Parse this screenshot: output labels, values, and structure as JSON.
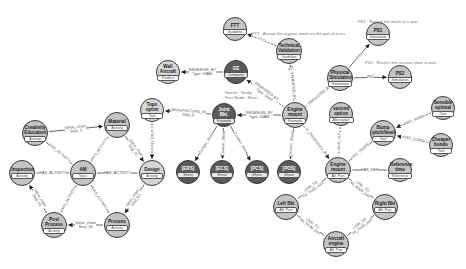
{
  "colors": {
    "node_fill": "#c4c4c4",
    "node_fill_light": "#d6d6d6",
    "node_fill_dark": "#5a5a5a",
    "node_border": "#3a3a3a",
    "edge": "#555555",
    "text": "#1a1a1a",
    "annotation": "#777777"
  },
  "nodes": [
    {
      "id": "creativity",
      "label": "Creativity Education",
      "type": "Activity",
      "x": 35,
      "y": 133,
      "r": 13,
      "shade": "mid"
    },
    {
      "id": "material",
      "label": "Material",
      "type": "Activity",
      "x": 117,
      "y": 125,
      "r": 13,
      "shade": "mid"
    },
    {
      "id": "topo",
      "label": "Topo optim",
      "type": "Tool",
      "x": 152,
      "y": 110,
      "r": 12,
      "shade": "light"
    },
    {
      "id": "am",
      "label": "AM",
      "type": "Topic",
      "x": 83,
      "y": 173,
      "r": 13,
      "shade": "mid"
    },
    {
      "id": "design",
      "label": "Design",
      "type": "Activity",
      "x": 152,
      "y": 173,
      "r": 13,
      "shade": "light"
    },
    {
      "id": "inspection",
      "label": "Inspection",
      "type": "Activity",
      "x": 22,
      "y": 173,
      "r": 13,
      "shade": "mid"
    },
    {
      "id": "postprocess",
      "label": "Post Process",
      "type": "Activity",
      "x": 54,
      "y": 225,
      "r": 13,
      "shade": "mid"
    },
    {
      "id": "process",
      "label": "Process",
      "type": "Activity",
      "x": 117,
      "y": 225,
      "r": 13,
      "shade": "mid"
    },
    {
      "id": "ftt",
      "label": "FTT",
      "type": "Guideline",
      "x": 235,
      "y": 29,
      "r": 12,
      "shade": "mid"
    },
    {
      "id": "tech",
      "label": "Technical Validation",
      "type": "Guideline",
      "x": 289,
      "y": 51,
      "r": 13,
      "shade": "mid"
    },
    {
      "id": "ge",
      "label": "GE",
      "type": "Company",
      "x": 236,
      "y": 72,
      "r": 12,
      "shade": "dark"
    },
    {
      "id": "nasa",
      "label": "Wall Aircraft",
      "type": "Product",
      "x": 168,
      "y": 72,
      "r": 12,
      "shade": "light"
    },
    {
      "id": "jointbkt",
      "label": "Joint Bkt.",
      "type": "Example",
      "x": 224,
      "y": 115,
      "r": 12,
      "shade": "dark"
    },
    {
      "id": "engine",
      "label": "Engine mount",
      "type": "Example",
      "x": 295,
      "y": 115,
      "r": 13,
      "shade": "mid"
    },
    {
      "id": "physical",
      "label": "Physical Simulation",
      "type": "Simulation",
      "x": 340,
      "y": 78,
      "r": 13,
      "shade": "mid"
    },
    {
      "id": "ps1",
      "label": "PS1",
      "type": "Simulation",
      "x": 378,
      "y": 34,
      "r": 12,
      "shade": "mid"
    },
    {
      "id": "ps2",
      "label": "PS2",
      "type": "Simulation",
      "x": 400,
      "y": 77,
      "r": 12,
      "shade": "mid"
    },
    {
      "id": "second",
      "label": "second option",
      "type": "Alternative",
      "x": 341,
      "y": 114,
      "r": 12,
      "shade": "mid"
    },
    {
      "id": "ers",
      "label": "[ERS]",
      "type": "Sheet",
      "x": 188,
      "y": 172,
      "r": 12,
      "shade": "dark"
    },
    {
      "id": "ecs",
      "label": "[ECS]",
      "type": "Sheet",
      "x": 222,
      "y": 172,
      "r": 12,
      "shade": "dark"
    },
    {
      "id": "pcs",
      "label": "[PCS]",
      "type": "Sheet",
      "x": 257,
      "y": 172,
      "r": 12,
      "shade": "dark"
    },
    {
      "id": "pos",
      "label": "[POS]",
      "type": "Sheet",
      "x": 289,
      "y": 172,
      "r": 12,
      "shade": "dark"
    },
    {
      "id": "enginemount2",
      "label": "Engine mount",
      "type": "Alt. Part",
      "x": 338,
      "y": 170,
      "r": 13,
      "shade": "mid"
    },
    {
      "id": "bump",
      "label": "Bump pitch/level",
      "type": "Tool",
      "x": 383,
      "y": 133,
      "r": 13,
      "shade": "mid"
    },
    {
      "id": "sensible",
      "label": "Sensible optimal",
      "type": "Tool",
      "x": 443,
      "y": 108,
      "r": 12,
      "shade": "mid"
    },
    {
      "id": "cheaper",
      "label": "Cheaper bonds",
      "type": "Tool",
      "x": 441,
      "y": 145,
      "r": 12,
      "shade": "mid"
    },
    {
      "id": "reference",
      "label": "Reference time",
      "type": "Reference",
      "x": 400,
      "y": 170,
      "r": 12,
      "shade": "mid"
    },
    {
      "id": "leftbkt",
      "label": "Left Bkt",
      "type": "Alt. Part",
      "x": 286,
      "y": 207,
      "r": 13,
      "shade": "mid"
    },
    {
      "id": "rightbkt",
      "label": "Right Bkt",
      "type": "Alt. Part",
      "x": 385,
      "y": 207,
      "r": 13,
      "shade": "mid"
    },
    {
      "id": "aircraft",
      "label": "Aircraft engine",
      "type": "Alt. Part",
      "x": 336,
      "y": 244,
      "r": 13,
      "shade": "mid"
    }
  ],
  "edges": [
    {
      "from": "creativity",
      "to": "material",
      "label": "Value_Chain\nStep_0",
      "style": "solid",
      "arrow": true
    },
    {
      "from": "material",
      "to": "design",
      "label": "Value_chain\nStep_02",
      "style": "solid",
      "arrow": true
    },
    {
      "from": "topo",
      "to": "design",
      "label": "Tool_Used",
      "style": "dashed",
      "arrow": true
    },
    {
      "from": "design",
      "to": "process",
      "label": "Value_chain\nStep_03",
      "style": "solid",
      "arrow": true
    },
    {
      "from": "process",
      "to": "postprocess",
      "label": "Value_chain\nStep_04",
      "style": "solid",
      "arrow": true
    },
    {
      "from": "postprocess",
      "to": "inspection",
      "label": "Value_chain\nStep_05",
      "style": "solid",
      "arrow": true
    },
    {
      "from": "am",
      "to": "creativity",
      "label": "HAS_ACTIVITY",
      "style": "solid",
      "arrow": false
    },
    {
      "from": "am",
      "to": "material",
      "label": "HAS_ACTIVITY",
      "style": "solid",
      "arrow": false
    },
    {
      "from": "am",
      "to": "design",
      "label": "HAS_ACTIVITY",
      "style": "solid",
      "arrow": false
    },
    {
      "from": "am",
      "to": "inspection",
      "label": "HAS_ACTIVITY",
      "style": "solid",
      "arrow": false
    },
    {
      "from": "am",
      "to": "process",
      "label": "HAS_ACTIVITY",
      "style": "solid",
      "arrow": false
    },
    {
      "from": "am",
      "to": "postprocess",
      "label": "HAS_ACTIVITY",
      "style": "solid",
      "arrow": false
    },
    {
      "from": "jointbkt",
      "to": "topo",
      "label": "MANUFACTURE_IN\nStep_8",
      "style": "solid",
      "arrow": true
    },
    {
      "from": "engine",
      "to": "jointbkt",
      "label": "REDESIGN_BY\nType: DfAM",
      "style": "solid",
      "arrow": true
    },
    {
      "from": "engine",
      "to": "ge",
      "label": "PROPOSED_BY\nType: Order",
      "style": "dashed",
      "arrow": true
    },
    {
      "from": "ge",
      "to": "nasa",
      "label": "REDESIGN_BY\nType: DfAM",
      "style": "solid",
      "arrow": true
    },
    {
      "from": "engine",
      "to": "tech",
      "label": "IS_VALIDATED_BY",
      "style": "dashed",
      "arrow": true
    },
    {
      "from": "tech",
      "to": "ftt",
      "label": "FTT",
      "style": "dashed",
      "arrow": true
    },
    {
      "from": "engine",
      "to": "physical",
      "label": "IS_SIMULATED_BY",
      "style": "dashed",
      "arrow": true
    },
    {
      "from": "physical",
      "to": "ps1",
      "label": "PS1",
      "style": "solid",
      "arrow": true
    },
    {
      "from": "physical",
      "to": "ps2",
      "label": "PS2",
      "style": "solid",
      "arrow": true
    },
    {
      "from": "jointbkt",
      "to": "ers",
      "label": "Contain_Sheet",
      "style": "solid",
      "arrow": true
    },
    {
      "from": "jointbkt",
      "to": "ecs",
      "label": "Contain_Sheet",
      "style": "solid",
      "arrow": true
    },
    {
      "from": "jointbkt",
      "to": "pcs",
      "label": "Contain_Sheet",
      "style": "solid",
      "arrow": true
    },
    {
      "from": "engine",
      "to": "pos",
      "label": "Contain_Sheet",
      "style": "solid",
      "arrow": true
    },
    {
      "from": "engine",
      "to": "enginemount2",
      "label": "IS_PROPOSED_BY",
      "style": "dashed",
      "arrow": true
    },
    {
      "from": "second",
      "to": "enginemount2",
      "label": "HAS_ALT",
      "style": "dashed",
      "arrow": false
    },
    {
      "from": "bump",
      "to": "enginemount2",
      "label": "HAS_SHAPE",
      "style": "solid",
      "arrow": false
    },
    {
      "from": "sensible",
      "to": "bump",
      "label": "HAS_SUBS",
      "style": "dashed",
      "arrow": true
    },
    {
      "from": "cheaper",
      "to": "bump",
      "label": "HAS_SUBS",
      "style": "dashed",
      "arrow": true
    },
    {
      "from": "reference",
      "to": "enginemount2",
      "label": "HAS_REF",
      "style": "solid",
      "arrow": false
    },
    {
      "from": "enginemount2",
      "to": "leftbkt",
      "label": "LINK_TO\nAlt_Node_part",
      "style": "solid",
      "arrow": false
    },
    {
      "from": "enginemount2",
      "to": "rightbkt",
      "label": "LINK_TO\nAlt_Node_part",
      "style": "solid",
      "arrow": false
    },
    {
      "from": "leftbkt",
      "to": "aircraft",
      "label": "LINK_TO\nAlt_Node_part",
      "style": "solid",
      "arrow": false
    },
    {
      "from": "rightbkt",
      "to": "aircraft",
      "label": "LINK_TO\nAlt_Node_part",
      "style": "solid",
      "arrow": false
    }
  ],
  "annotations": [
    {
      "text": "FTT : Accept the organic mesh on the part of truss",
      "x": 252,
      "y": 31
    },
    {
      "text": "PS1 : Restart the mesh at a part",
      "x": 358,
      "y": 19
    },
    {
      "text": "PS2 : Restrict the version close to part",
      "x": 365,
      "y": 60
    },
    {
      "text": "Starter : Study\nFirst Node : Main",
      "x": 225,
      "y": 90
    }
  ]
}
